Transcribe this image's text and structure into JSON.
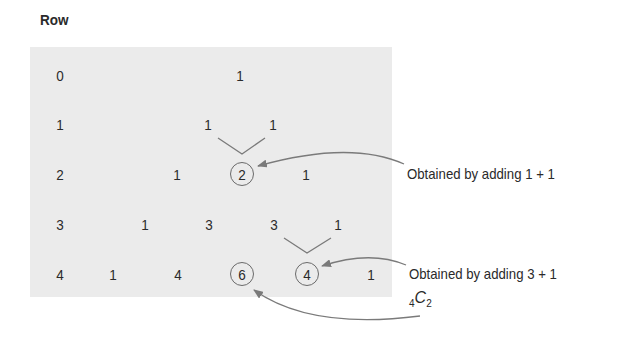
{
  "heading": "Row",
  "rows": [
    {
      "label": "0",
      "values": [
        "1"
      ]
    },
    {
      "label": "1",
      "values": [
        "1",
        "1"
      ]
    },
    {
      "label": "2",
      "values": [
        "1",
        "2",
        "1"
      ]
    },
    {
      "label": "3",
      "values": [
        "1",
        "3",
        "3",
        "1"
      ]
    },
    {
      "label": "4",
      "values": [
        "1",
        "4",
        "6",
        "4",
        "1"
      ]
    }
  ],
  "highlighted": [
    {
      "row": 2,
      "index": 1,
      "value": "2"
    },
    {
      "row": 4,
      "index": 2,
      "value": "6"
    },
    {
      "row": 4,
      "index": 3,
      "value": "4"
    }
  ],
  "annotations": {
    "note1": "Obtained by adding 1 + 1",
    "note2": "Obtained by adding 3 + 1",
    "combination": {
      "pre_subscript": "4",
      "letter": "C",
      "subscript": "2"
    }
  },
  "colors": {
    "panel": "#ebebeb",
    "text": "#2a2a2a",
    "arrow": "#7a7a7a"
  }
}
